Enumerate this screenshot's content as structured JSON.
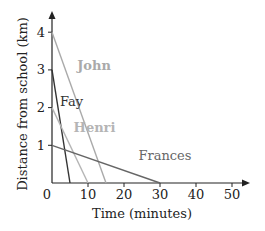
{
  "chart_data": {
    "type": "line",
    "title": "",
    "xlabel": "Time (minutes)",
    "ylabel": "Distance from school (km)",
    "xlim": [
      0,
      55
    ],
    "ylim": [
      0,
      4.4
    ],
    "x_ticks": [
      0,
      10,
      20,
      30,
      40,
      50
    ],
    "y_ticks": [
      1,
      2,
      3,
      4
    ],
    "grid": false,
    "legend": "inline labels",
    "series": [
      {
        "name": "John",
        "color": "#aaaaaa",
        "points": [
          [
            0,
            4
          ],
          [
            15,
            0
          ]
        ],
        "label_pos": [
          7,
          3
        ]
      },
      {
        "name": "Fay",
        "color": "#333333",
        "points": [
          [
            0,
            3
          ],
          [
            5,
            0
          ]
        ],
        "label_pos": [
          2.2,
          2.05
        ]
      },
      {
        "name": "Henri",
        "color": "#b5b5b5",
        "points": [
          [
            0,
            2
          ],
          [
            10,
            0
          ]
        ],
        "label_pos": [
          6,
          1.35
        ]
      },
      {
        "name": "Frances",
        "color": "#666666",
        "points": [
          [
            0,
            1
          ],
          [
            30,
            0
          ]
        ],
        "label_pos": [
          24,
          0.6
        ]
      }
    ]
  }
}
